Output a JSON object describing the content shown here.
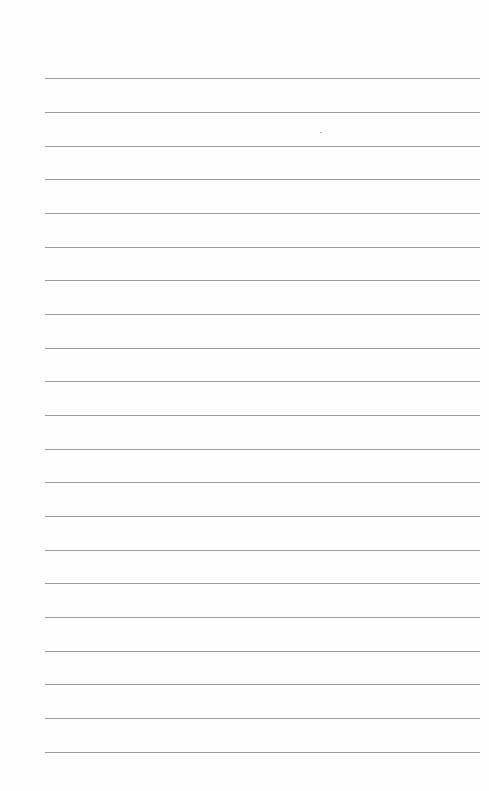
{
  "document": {
    "type": "lined-paper",
    "line_count": 21,
    "line_color": "#9a9a9a",
    "background": "#fefefe",
    "text": ""
  }
}
